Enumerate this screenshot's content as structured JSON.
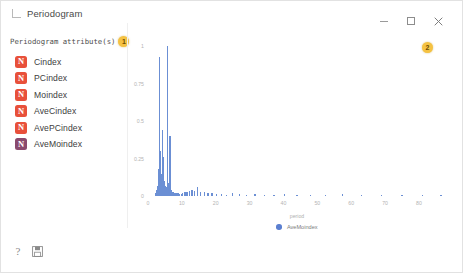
{
  "window": {
    "title": "Periodogram",
    "app_icon": "window-corner-icon",
    "controls": {
      "minimize": "minimize-icon",
      "maximize": "maximize-icon",
      "close": "close-icon"
    }
  },
  "left_panel": {
    "header_label": "Periodogram attribute(s)",
    "badge": "1",
    "items": [
      {
        "label": "Cindex",
        "icon_glyph": "N",
        "icon_color": "#e8503a"
      },
      {
        "label": "PCindex",
        "icon_glyph": "N",
        "icon_color": "#e8503a"
      },
      {
        "label": "Moindex",
        "icon_glyph": "N",
        "icon_color": "#e8503a"
      },
      {
        "label": "AveCindex",
        "icon_glyph": "N",
        "icon_color": "#e8503a"
      },
      {
        "label": "AvePCindex",
        "icon_glyph": "N",
        "icon_color": "#e8503a"
      },
      {
        "label": "AveMoindex",
        "icon_glyph": "N",
        "icon_color": "#8a4a6e"
      }
    ]
  },
  "chart_badge": "2",
  "footer": {
    "help_icon": "help-question-icon",
    "save_icon": "save-disk-icon"
  },
  "colors": {
    "bar": "#6b8fd4",
    "legend_dot": "#5b7fd0",
    "badge": "#f5c242",
    "attr_icon_red": "#e8503a",
    "attr_icon_purple": "#8a4a6e"
  },
  "chart_data": {
    "type": "bar",
    "title": "",
    "xlabel": "period",
    "ylabel": "",
    "xlim": [
      0,
      88
    ],
    "ylim": [
      0,
      1
    ],
    "grid": false,
    "legend_position": "bottom",
    "legend": [
      "AveMoindex"
    ],
    "xticks": [
      0,
      10,
      20,
      30,
      40,
      50,
      60,
      70,
      80
    ],
    "yticks": [
      0,
      0.25,
      0.5,
      0.75,
      1
    ],
    "series": [
      {
        "name": "AveMoindex",
        "x": [
          2.1,
          2.4,
          2.7,
          3.0,
          3.2,
          3.4,
          3.6,
          3.8,
          4.0,
          4.2,
          4.35,
          4.5,
          4.65,
          4.8,
          4.95,
          5.1,
          5.3,
          5.5,
          5.7,
          5.9,
          6.1,
          6.3,
          6.5,
          6.7,
          6.9,
          7.1,
          7.3,
          7.5,
          7.7,
          7.9,
          8.1,
          8.4,
          8.7,
          9.0,
          9.4,
          9.8,
          10.3,
          10.9,
          11.5,
          12.2,
          13.0,
          13.8,
          14.7,
          15.6,
          16.6,
          17.7,
          18.9,
          20.2,
          21.6,
          23.2,
          25.0,
          27.0,
          29.2,
          31.6,
          34.3,
          37.2,
          40.4,
          44.0,
          48.0,
          52.5,
          57.5,
          63.0,
          69.0,
          75.0,
          81.0,
          86.5
        ],
        "y": [
          0.02,
          0.04,
          0.07,
          0.12,
          0.18,
          0.93,
          0.3,
          0.22,
          0.15,
          0.11,
          0.44,
          0.26,
          0.14,
          0.1,
          0.08,
          0.07,
          0.06,
          0.05,
          1.0,
          0.09,
          0.05,
          0.04,
          0.4,
          0.06,
          0.04,
          0.03,
          0.03,
          0.03,
          0.02,
          0.02,
          0.02,
          0.02,
          0.02,
          0.02,
          0.015,
          0.015,
          0.02,
          0.025,
          0.03,
          0.035,
          0.04,
          0.035,
          0.06,
          0.03,
          0.025,
          0.02,
          0.02,
          0.015,
          0.012,
          0.01,
          0.018,
          0.012,
          0.01,
          0.015,
          0.008,
          0.01,
          0.012,
          0.008,
          0.007,
          0.006,
          0.012,
          0.006,
          0.005,
          0.005,
          0.004,
          0.008
        ]
      }
    ]
  }
}
